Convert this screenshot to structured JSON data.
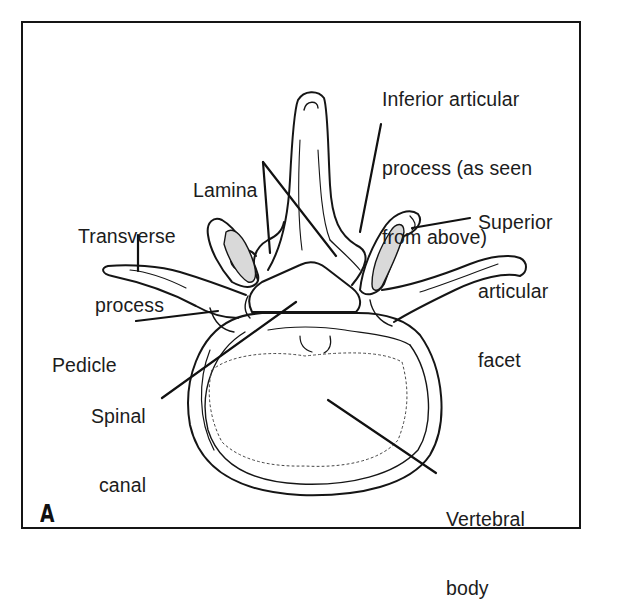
{
  "figure": {
    "panel_letter": "A",
    "colors": {
      "line": "#151515",
      "facet_fill": "#d9d9d9",
      "background": "#ffffff"
    }
  },
  "labels": {
    "inferior_articular_process": {
      "line1": "Inferior articular",
      "line2": "process (as seen",
      "line3": "from above)"
    },
    "lamina": {
      "line1": "Lamina"
    },
    "superior_articular_facet": {
      "line1": "Superior",
      "line2": "articular",
      "line3": "facet"
    },
    "transverse_process": {
      "line1": "Transverse",
      "line2": "process"
    },
    "pedicle": {
      "line1": "Pedicle"
    },
    "spinal_canal": {
      "line1": "Spinal",
      "line2": "canal"
    },
    "vertebral_body": {
      "line1": "Vertebral",
      "line2": "body"
    }
  }
}
